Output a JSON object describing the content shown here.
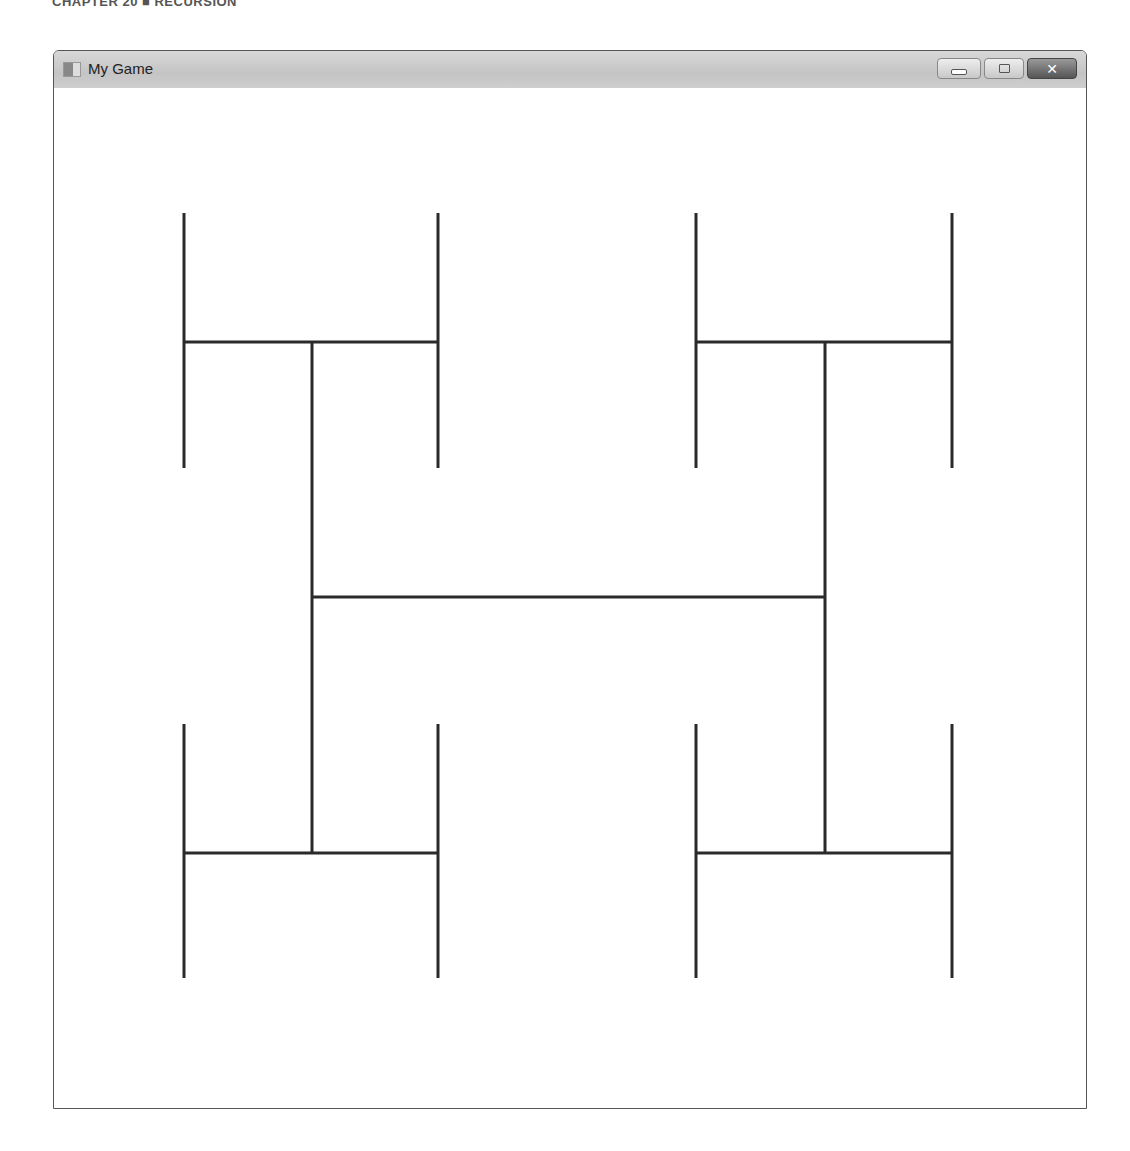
{
  "page_header": "CHAPTER 20 ■ RECURSION",
  "window": {
    "title": "My Game",
    "controls": {
      "minimize": "minimize",
      "maximize": "maximize",
      "close": "✕"
    }
  },
  "drawing": {
    "type": "H-tree fractal",
    "stroke_color": "#2a2a2a",
    "stroke_width": 3,
    "lines": [
      {
        "x1": 312,
        "y1": 597,
        "x2": 825,
        "y2": 597
      },
      {
        "x1": 312,
        "y1": 342,
        "x2": 312,
        "y2": 853
      },
      {
        "x1": 825,
        "y1": 342,
        "x2": 825,
        "y2": 853
      },
      {
        "x1": 184,
        "y1": 342,
        "x2": 438,
        "y2": 342
      },
      {
        "x1": 696,
        "y1": 342,
        "x2": 952,
        "y2": 342
      },
      {
        "x1": 184,
        "y1": 853,
        "x2": 438,
        "y2": 853
      },
      {
        "x1": 696,
        "y1": 853,
        "x2": 952,
        "y2": 853
      },
      {
        "x1": 184,
        "y1": 213,
        "x2": 184,
        "y2": 468
      },
      {
        "x1": 438,
        "y1": 213,
        "x2": 438,
        "y2": 468
      },
      {
        "x1": 696,
        "y1": 213,
        "x2": 696,
        "y2": 468
      },
      {
        "x1": 952,
        "y1": 213,
        "x2": 952,
        "y2": 468
      },
      {
        "x1": 184,
        "y1": 724,
        "x2": 184,
        "y2": 978
      },
      {
        "x1": 438,
        "y1": 724,
        "x2": 438,
        "y2": 978
      },
      {
        "x1": 696,
        "y1": 724,
        "x2": 696,
        "y2": 978
      },
      {
        "x1": 952,
        "y1": 724,
        "x2": 952,
        "y2": 978
      }
    ]
  }
}
